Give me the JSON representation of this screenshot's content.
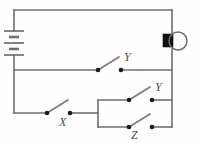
{
  "diagram": {
    "type": "electrical-circuit-schematic",
    "background_color": "#fefefe",
    "wire_color": "#6e6e6e",
    "node_color": "#1b1b1b",
    "label_color": "#4a4a4a"
  },
  "labels": {
    "switch_y_top": "Y",
    "switch_x": "X",
    "switch_y_parallel": "Y",
    "switch_z_parallel": "Z"
  },
  "components": [
    {
      "id": "battery",
      "name": "battery",
      "symbol": "multi-cell-battery",
      "orientation": "vertical",
      "position": {
        "x": 14,
        "y": 42
      },
      "cells": 2
    },
    {
      "id": "lamp",
      "name": "lamp",
      "symbol": "bulb-with-base",
      "position": {
        "x": 176,
        "y": 41
      },
      "state": "unlit"
    },
    {
      "id": "switch-y-top",
      "name": "switch",
      "label": "Y",
      "state": "open",
      "branch": "middle-branch",
      "position": {
        "x": 109,
        "y": 70
      }
    },
    {
      "id": "switch-x",
      "name": "switch",
      "label": "X",
      "state": "open",
      "branch": "bottom-branch",
      "position": {
        "x": 58,
        "y": 113
      }
    },
    {
      "id": "switch-y-parallel",
      "name": "switch",
      "label": "Y",
      "state": "open",
      "branch": "parallel-upper",
      "position": {
        "x": 140,
        "y": 100
      }
    },
    {
      "id": "switch-z-parallel",
      "name": "switch",
      "label": "Z",
      "state": "open",
      "branch": "parallel-lower",
      "position": {
        "x": 140,
        "y": 127
      }
    }
  ],
  "nodes": [
    {
      "name": "y-top-left-contact",
      "x": 98,
      "y": 70
    },
    {
      "name": "y-top-right-contact",
      "x": 121,
      "y": 70
    },
    {
      "name": "x-left-contact",
      "x": 47,
      "y": 113
    },
    {
      "name": "x-right-contact",
      "x": 70,
      "y": 113
    },
    {
      "name": "y-parallel-left-contact",
      "x": 129,
      "y": 100
    },
    {
      "name": "y-parallel-right-contact",
      "x": 152,
      "y": 100
    },
    {
      "name": "z-parallel-left-contact",
      "x": 129,
      "y": 127
    },
    {
      "name": "z-parallel-right-contact",
      "x": 152,
      "y": 127
    }
  ]
}
